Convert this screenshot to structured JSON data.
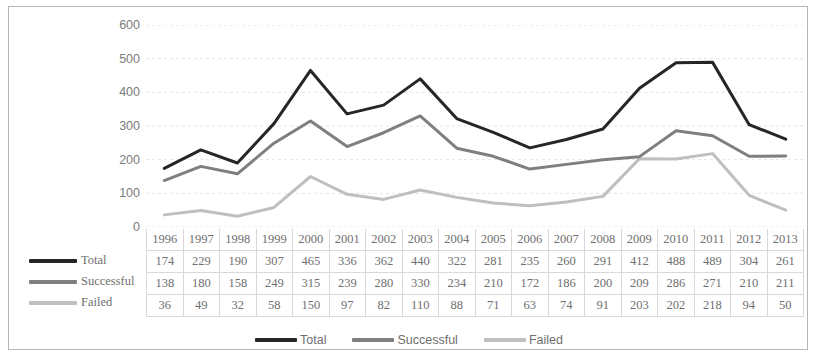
{
  "chart_data": {
    "type": "line",
    "title": "",
    "subtitle": "",
    "xlabel": "",
    "ylabel": "",
    "categories": [
      "1996",
      "1997",
      "1998",
      "1999",
      "2000",
      "2001",
      "2002",
      "2003",
      "2004",
      "2005",
      "2006",
      "2007",
      "2008",
      "2009",
      "2010",
      "2011",
      "2012",
      "2013"
    ],
    "series": [
      {
        "name": "Total",
        "color": "#262626",
        "values": [
          174,
          229,
          190,
          307,
          465,
          336,
          362,
          440,
          322,
          281,
          235,
          260,
          291,
          412,
          488,
          489,
          304,
          261
        ]
      },
      {
        "name": "Successful",
        "color": "#7f7f7f",
        "values": [
          138,
          180,
          158,
          249,
          315,
          239,
          280,
          330,
          234,
          210,
          172,
          186,
          200,
          209,
          286,
          271,
          210,
          211
        ]
      },
      {
        "name": "Failed",
        "color": "#bfbfbf",
        "values": [
          36,
          49,
          32,
          58,
          150,
          97,
          82,
          110,
          88,
          71,
          63,
          74,
          91,
          203,
          202,
          218,
          94,
          50
        ]
      }
    ],
    "ylim": [
      0,
      600
    ],
    "ytick_step": 100,
    "yticks": [
      "600",
      "500",
      "400",
      "300",
      "200",
      "100",
      "0"
    ],
    "grid": true,
    "grid_axis": "y",
    "legend_position": "bottom",
    "markers": false,
    "line_width": 3
  },
  "table": {
    "header": [
      "1996",
      "1997",
      "1998",
      "1999",
      "2000",
      "2001",
      "2002",
      "2003",
      "2004",
      "2005",
      "2006",
      "2007",
      "2008",
      "2009",
      "2010",
      "2011",
      "2012",
      "2013"
    ],
    "rows": [
      {
        "label": "Total",
        "values": [
          "174",
          "229",
          "190",
          "307",
          "465",
          "336",
          "362",
          "440",
          "322",
          "281",
          "235",
          "260",
          "291",
          "412",
          "488",
          "489",
          "304",
          "261"
        ]
      },
      {
        "label": "Successful",
        "values": [
          "138",
          "180",
          "158",
          "249",
          "315",
          "239",
          "280",
          "330",
          "234",
          "210",
          "172",
          "186",
          "200",
          "209",
          "286",
          "271",
          "210",
          "211"
        ]
      },
      {
        "label": "Failed",
        "values": [
          "36",
          "49",
          "32",
          "58",
          "150",
          "97",
          "82",
          "110",
          "88",
          "71",
          "63",
          "74",
          "91",
          "203",
          "202",
          "218",
          "94",
          "50"
        ]
      }
    ]
  },
  "legend": {
    "items": [
      {
        "label": "Total",
        "color": "#262626"
      },
      {
        "label": "Successful",
        "color": "#7f7f7f"
      },
      {
        "label": "Failed",
        "color": "#bfbfbf"
      }
    ]
  },
  "style": {
    "gridline_color": "#e4e4e4",
    "border_color": "#b6b6b6",
    "table_border_color": "#d9d9d9",
    "text_color": "#6f6f6f"
  }
}
